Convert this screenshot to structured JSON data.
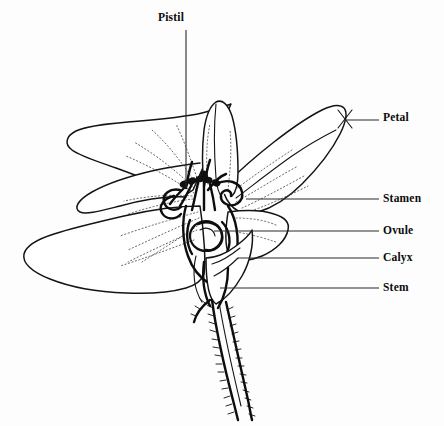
{
  "figure": {
    "style": "black and white stippled botanical illustration",
    "background_color": "#fdfdfd",
    "ink_color": "#111111"
  },
  "labels": [
    {
      "id": "pistil",
      "text": "Pistil",
      "x": 158,
      "y": 12,
      "leader": {
        "type": "vertical",
        "x1": 186,
        "y1": 30,
        "x2": 186,
        "y2": 188
      }
    },
    {
      "id": "petal",
      "text": "Petal",
      "x": 383,
      "y": 112,
      "leader": {
        "type": "horizontal",
        "x1": 345,
        "y1": 120,
        "x2": 379,
        "y2": 120
      },
      "marker": "x-cross"
    },
    {
      "id": "stamen",
      "text": "Stamen",
      "x": 383,
      "y": 193,
      "leader": {
        "type": "horizontal",
        "x1": 246,
        "y1": 199,
        "x2": 379,
        "y2": 199
      }
    },
    {
      "id": "ovule",
      "text": "Ovule",
      "x": 383,
      "y": 225,
      "leader": {
        "type": "horizontal",
        "x1": 214,
        "y1": 231,
        "x2": 379,
        "y2": 231
      }
    },
    {
      "id": "calyx",
      "text": "Calyx",
      "x": 383,
      "y": 252,
      "leader": {
        "type": "horizontal",
        "x1": 238,
        "y1": 258,
        "x2": 379,
        "y2": 258
      }
    },
    {
      "id": "stem",
      "text": "Stem",
      "x": 383,
      "y": 282,
      "leader": {
        "type": "horizontal",
        "x1": 220,
        "y1": 288,
        "x2": 379,
        "y2": 288
      }
    }
  ],
  "parts": [
    {
      "id": "petal-upper-left",
      "name": "upper left petal"
    },
    {
      "id": "petal-lower-left",
      "name": "lower left petal"
    },
    {
      "id": "petal-upper-right",
      "name": "upper right petal"
    },
    {
      "id": "petal-lower-right",
      "name": "lower right petal"
    },
    {
      "id": "pistil-structure",
      "name": "pistil"
    },
    {
      "id": "stamen-cluster",
      "name": "stamens"
    },
    {
      "id": "ovule-body",
      "name": "ovule"
    },
    {
      "id": "calyx-sepals",
      "name": "calyx"
    },
    {
      "id": "stem-stalk",
      "name": "hairy stem"
    }
  ]
}
